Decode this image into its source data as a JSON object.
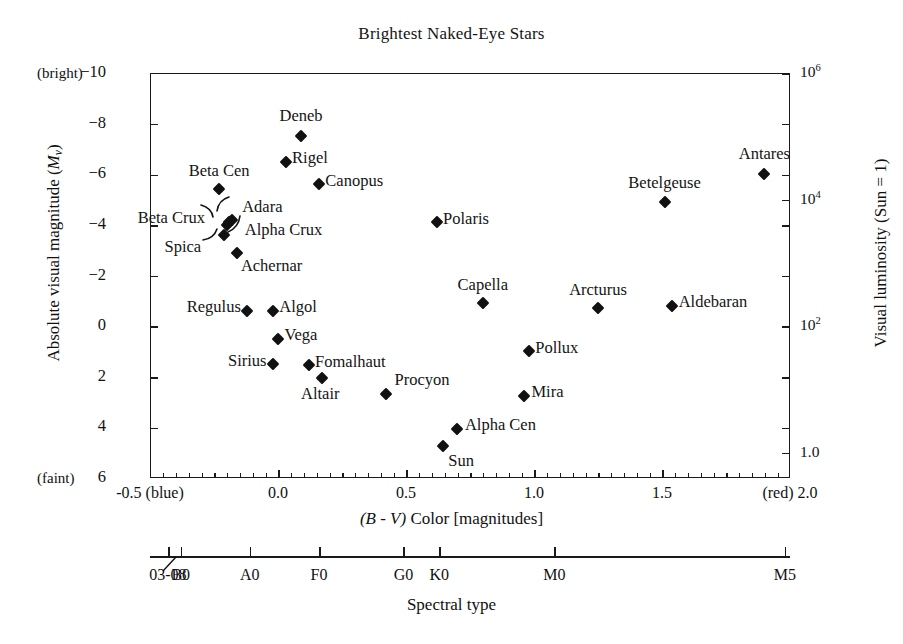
{
  "chart_data": {
    "type": "scatter",
    "title": "Brightest Naked-Eye Stars",
    "xlabel": "(B - V) Color [magnitudes]",
    "ylabel": "Absolute visual magnitude (Mv)",
    "y2label": "Visual luminosity (Sun = 1)",
    "x2label": "Spectral type",
    "xlim": [
      -0.5,
      2.0
    ],
    "ylim": [
      6,
      -10
    ],
    "y_inverted": true,
    "grid": false,
    "legend": "none",
    "x_ticks": [
      {
        "value": -0.5,
        "label": "-0.5 (blue)"
      },
      {
        "value": 0.0,
        "label": "0.0"
      },
      {
        "value": 0.5,
        "label": "0.5"
      },
      {
        "value": 1.0,
        "label": "1.0"
      },
      {
        "value": 1.5,
        "label": "1.5"
      },
      {
        "value": 2.0,
        "label": "(red) 2.0"
      }
    ],
    "x_minor_tick_step": 0.05,
    "y_ticks": [
      {
        "value": -10,
        "label": "-10"
      },
      {
        "value": -8,
        "label": "-8"
      },
      {
        "value": -6,
        "label": "-6"
      },
      {
        "value": -4,
        "label": "-4"
      },
      {
        "value": -2,
        "label": "-2"
      },
      {
        "value": 0,
        "label": "0"
      },
      {
        "value": 2,
        "label": "2"
      },
      {
        "value": 4,
        "label": "4"
      },
      {
        "value": 6,
        "label": "6"
      }
    ],
    "y_edge_annotations": [
      {
        "value": -10,
        "label": "(bright)"
      },
      {
        "value": 6,
        "label": "(faint)"
      }
    ],
    "y2_ticks": [
      {
        "value": -10,
        "mantissa": "10",
        "exponent": "6",
        "label": "10^6"
      },
      {
        "value": -5,
        "mantissa": "10",
        "exponent": "4",
        "label": "10^4"
      },
      {
        "value": 0,
        "mantissa": "10",
        "exponent": "2",
        "label": "10^2"
      },
      {
        "value": 5,
        "mantissa": "1.0",
        "exponent": "",
        "label": "1.0"
      }
    ],
    "spectral_ticks": [
      {
        "x": -0.43,
        "label": "03-08",
        "pointer": true
      },
      {
        "x": -0.38,
        "label": "B0",
        "pointer": false
      },
      {
        "x": -0.11,
        "label": "A0",
        "pointer": false
      },
      {
        "x": 0.16,
        "label": "F0",
        "pointer": false
      },
      {
        "x": 0.49,
        "label": "G0",
        "pointer": false
      },
      {
        "x": 0.63,
        "label": "K0",
        "pointer": false
      },
      {
        "x": 1.08,
        "label": "M0",
        "pointer": false
      },
      {
        "x": 1.98,
        "label": "M5",
        "pointer": false
      }
    ],
    "points": [
      {
        "name": "Deneb",
        "x": 0.09,
        "y": -7.5,
        "label": "Deneb",
        "lx": 0.09,
        "ly": -8.25,
        "align": "center",
        "leader": false
      },
      {
        "name": "Rigel",
        "x": 0.03,
        "y": -6.5,
        "label": "Rigel",
        "lx": 0.055,
        "ly": -6.6,
        "align": "start",
        "leader": false
      },
      {
        "name": "Canopus",
        "x": 0.16,
        "y": -5.6,
        "label": "Canopus",
        "lx": 0.185,
        "ly": -5.7,
        "align": "start",
        "leader": false
      },
      {
        "name": "Beta Cen",
        "x": -0.23,
        "y": -5.4,
        "label": "Beta Cen",
        "lx": -0.23,
        "ly": -6.1,
        "align": "center",
        "leader": false
      },
      {
        "name": "Adara",
        "x": -0.18,
        "y": -4.2,
        "label": "Adara",
        "lx": -0.14,
        "ly": -4.65,
        "align": "start",
        "leader": true
      },
      {
        "name": "Beta Crux",
        "x": -0.2,
        "y": -4.0,
        "label": "Beta Crux",
        "lx": -0.285,
        "ly": -4.25,
        "align": "end",
        "leader": true
      },
      {
        "name": "Alpha Crux",
        "x": -0.19,
        "y": -4.1,
        "label": "Alpha Crux",
        "lx": -0.13,
        "ly": -3.75,
        "align": "start",
        "leader": true
      },
      {
        "name": "Spica",
        "x": -0.21,
        "y": -3.6,
        "label": "Spica",
        "lx": -0.3,
        "ly": -3.1,
        "align": "end",
        "leader": true
      },
      {
        "name": "Achernar",
        "x": -0.16,
        "y": -2.9,
        "label": "Achernar",
        "lx": -0.145,
        "ly": -2.35,
        "align": "start",
        "leader": false
      },
      {
        "name": "Polaris",
        "x": 0.62,
        "y": -4.1,
        "label": "Polaris",
        "lx": 0.645,
        "ly": -4.2,
        "align": "start",
        "leader": false
      },
      {
        "name": "Betelgeuse",
        "x": 1.51,
        "y": -4.9,
        "label": "Betelgeuse",
        "lx": 1.51,
        "ly": -5.6,
        "align": "center",
        "leader": false
      },
      {
        "name": "Antares",
        "x": 1.9,
        "y": -6.0,
        "label": "Antares",
        "lx": 1.9,
        "ly": -6.75,
        "align": "center",
        "leader": false
      },
      {
        "name": "Capella",
        "x": 0.8,
        "y": -0.9,
        "label": "Capella",
        "lx": 0.8,
        "ly": -1.6,
        "align": "center",
        "leader": false
      },
      {
        "name": "Arcturus",
        "x": 1.25,
        "y": -0.7,
        "label": "Arcturus",
        "lx": 1.25,
        "ly": -1.4,
        "align": "center",
        "leader": false
      },
      {
        "name": "Aldebaran",
        "x": 1.54,
        "y": -0.8,
        "label": "Aldebaran",
        "lx": 1.565,
        "ly": -0.9,
        "align": "start",
        "leader": false
      },
      {
        "name": "Regulus",
        "x": -0.12,
        "y": -0.6,
        "label": "Regulus",
        "lx": -0.145,
        "ly": -0.7,
        "align": "end",
        "leader": false
      },
      {
        "name": "Algol",
        "x": -0.02,
        "y": -0.6,
        "label": "Algol",
        "lx": 0.005,
        "ly": -0.7,
        "align": "start",
        "leader": false
      },
      {
        "name": "Vega",
        "x": 0.0,
        "y": 0.5,
        "label": "Vega",
        "lx": 0.025,
        "ly": 0.4,
        "align": "start",
        "leader": false
      },
      {
        "name": "Sirius",
        "x": -0.02,
        "y": 1.5,
        "label": "Sirius",
        "lx": -0.045,
        "ly": 1.4,
        "align": "end",
        "leader": false
      },
      {
        "name": "Fomalhaut",
        "x": 0.12,
        "y": 1.55,
        "label": "Fomalhaut",
        "lx": 0.145,
        "ly": 1.45,
        "align": "start",
        "leader": false
      },
      {
        "name": "Altair",
        "x": 0.17,
        "y": 2.05,
        "label": "Altair",
        "lx": 0.165,
        "ly": 2.72,
        "align": "center",
        "leader": false
      },
      {
        "name": "Procyon",
        "x": 0.42,
        "y": 2.7,
        "label": "Procyon",
        "lx": 0.455,
        "ly": 2.15,
        "align": "start",
        "leader": false
      },
      {
        "name": "Pollux",
        "x": 0.98,
        "y": 1.0,
        "label": "Pollux",
        "lx": 1.005,
        "ly": 0.9,
        "align": "start",
        "leader": false
      },
      {
        "name": "Mira",
        "x": 0.96,
        "y": 2.75,
        "label": "Mira",
        "lx": 0.99,
        "ly": 2.65,
        "align": "start",
        "leader": false
      },
      {
        "name": "Alpha Cen",
        "x": 0.7,
        "y": 4.05,
        "label": "Alpha Cen",
        "lx": 0.73,
        "ly": 3.95,
        "align": "start",
        "leader": false
      },
      {
        "name": "Sun",
        "x": 0.645,
        "y": 4.75,
        "label": "Sun",
        "lx": 0.665,
        "ly": 5.35,
        "align": "start",
        "leader": false
      }
    ]
  }
}
